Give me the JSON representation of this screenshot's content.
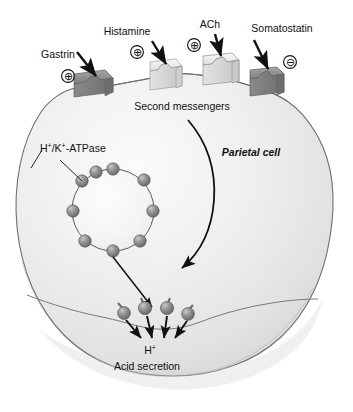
{
  "figure": {
    "cell_label": "Parietal cell",
    "second_messengers_label": "Second messengers",
    "atpase_label_main": "H",
    "atpase_label_sup1": "+",
    "atpase_label_mid": "/K",
    "atpase_label_sup2": "+",
    "atpase_label_end": "-ATPase",
    "proton_label": "H",
    "proton_sup": "+",
    "acid_secretion_label": "Acid secretion"
  },
  "receptors": [
    {
      "id": "gastrin",
      "label": "Gastrin",
      "sign": "⊕",
      "effect": "stimulatory",
      "color": "#8c8c8c",
      "label_x": 58,
      "label_y": 58,
      "sign_x": 68,
      "sign_y": 76,
      "block_x": 88,
      "block_y": 80
    },
    {
      "id": "histamine",
      "label": "Histamine",
      "sign": "⊕",
      "effect": "stimulatory",
      "color": "#e2e2e2",
      "label_x": 127,
      "label_y": 35,
      "sign_x": 137,
      "sign_y": 52,
      "block_x": 158,
      "block_y": 66
    },
    {
      "id": "ach",
      "label": "ACh",
      "sign": "⊕",
      "effect": "stimulatory",
      "color": "#e8e8e8",
      "label_x": 196,
      "label_y": 28,
      "sign_x": 194,
      "sign_y": 45,
      "block_x": 212,
      "block_y": 60
    },
    {
      "id": "somatostatin",
      "label": "Somatostatin",
      "sign": "⊖",
      "effect": "inhibitory",
      "color": "#9a9a9a",
      "label_x": 238,
      "label_y": 32,
      "sign_x": 284,
      "sign_y": 62,
      "block_x": 262,
      "block_y": 72
    }
  ],
  "vesicle": {
    "name": "tubulovesicle",
    "center_x": 113,
    "center_y": 210,
    "radius": 41,
    "pump_count": 9,
    "pump_color": "#808080"
  },
  "secretion": {
    "pump_count": 4,
    "pump_color": "#808080",
    "arrow_count": 4
  },
  "colors": {
    "cell_fill_light": "#f2f2f2",
    "cell_fill_mid": "#e4e4e4",
    "cell_fill_dark": "#d6d6d6",
    "outline": "#6b6b6b",
    "text": "#111111",
    "receptor_dark": "#8c8c8c",
    "receptor_light": "#e6e6e6",
    "sphere": "#808080"
  }
}
